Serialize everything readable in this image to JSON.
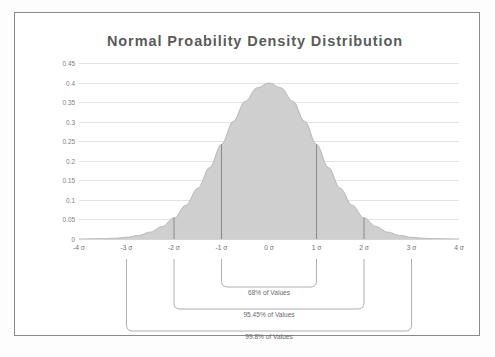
{
  "chart_data": {
    "type": "area",
    "title": "Normal Proability Density Distribution",
    "xlabel": "",
    "ylabel": "",
    "xlim": [
      -4,
      4
    ],
    "ylim": [
      0,
      0.45
    ],
    "grid": true,
    "legend": "none",
    "x_tick_labels": [
      "-4 σ",
      "-3 σ",
      "-2 σ",
      "-1 σ",
      "0 σ",
      "1 σ",
      "2 σ",
      "3 σ",
      "4 σ"
    ],
    "x_tick_values": [
      -4,
      -3,
      -2,
      -1,
      0,
      1,
      2,
      3,
      4
    ],
    "y_tick_labels": [
      "0.45",
      "0.4",
      "0.35",
      "0.3",
      "0.25",
      "0.2",
      "0.15",
      "0.1",
      "0.05",
      "0"
    ],
    "y_tick_values": [
      0.45,
      0.4,
      0.35,
      0.3,
      0.25,
      0.2,
      0.15,
      0.1,
      0.05,
      0
    ],
    "series": [
      {
        "name": "Normal PDF",
        "fill_color": "#cfcfcf",
        "line_color": "#b4b4b4",
        "x": [
          -4,
          -3.75,
          -3.5,
          -3.25,
          -3,
          -2.75,
          -2.5,
          -2.25,
          -2,
          -1.75,
          -1.5,
          -1.25,
          -1,
          -0.75,
          -0.5,
          -0.25,
          0,
          0.25,
          0.5,
          0.75,
          1,
          1.25,
          1.5,
          1.75,
          2,
          2.25,
          2.5,
          2.75,
          3,
          3.25,
          3.5,
          3.75,
          4
        ],
        "values": [
          0.0001,
          0.0004,
          0.0009,
          0.002,
          0.0044,
          0.0091,
          0.0175,
          0.0317,
          0.054,
          0.0863,
          0.1295,
          0.1826,
          0.242,
          0.3011,
          0.3521,
          0.3867,
          0.3989,
          0.3867,
          0.3521,
          0.3011,
          0.242,
          0.1826,
          0.1295,
          0.0863,
          0.054,
          0.0317,
          0.0175,
          0.0091,
          0.0044,
          0.002,
          0.0009,
          0.0004,
          0.0001
        ]
      }
    ],
    "drop_lines": [
      {
        "x": -2,
        "y": 0.054
      },
      {
        "x": -1,
        "y": 0.242
      },
      {
        "x": 1,
        "y": 0.242
      },
      {
        "x": 2,
        "y": 0.054
      }
    ],
    "annotations": [
      {
        "label": "68% of Values",
        "from": -1,
        "to": 1
      },
      {
        "label": "95.45% of Values",
        "from": -2,
        "to": 2
      },
      {
        "label": "99.8% of Values",
        "from": -3,
        "to": 3
      }
    ]
  },
  "chart": {
    "title": "Normal Proability Density Distribution",
    "title_color": "#5b5b5b",
    "axis_label_color": "#6e6e6e",
    "gridline_color": "#e3e3e3",
    "area_fill_color": "#cfcfcf",
    "dropline_color": "#6a6a6a",
    "bracket_color": "#9a9a9a"
  },
  "y_ticks": [
    {
      "label": "0.45",
      "value": 0.45
    },
    {
      "label": "0.4",
      "value": 0.4
    },
    {
      "label": "0.35",
      "value": 0.35
    },
    {
      "label": "0.3",
      "value": 0.3
    },
    {
      "label": "0.25",
      "value": 0.25
    },
    {
      "label": "0.2",
      "value": 0.2
    },
    {
      "label": "0.15",
      "value": 0.15
    },
    {
      "label": "0.1",
      "value": 0.1
    },
    {
      "label": "0.05",
      "value": 0.05
    },
    {
      "label": "0",
      "value": 0
    }
  ],
  "x_ticks": [
    {
      "label": "-4 σ",
      "value": -4
    },
    {
      "label": "-3 σ",
      "value": -3
    },
    {
      "label": "-2 σ",
      "value": -2
    },
    {
      "label": "-1 σ",
      "value": -1
    },
    {
      "label": "0 σ",
      "value": 0
    },
    {
      "label": "1 σ",
      "value": 1
    },
    {
      "label": "2 σ",
      "value": 2
    },
    {
      "label": "3 σ",
      "value": 3
    },
    {
      "label": "4 σ",
      "value": 4
    }
  ],
  "brackets": [
    {
      "label": "68% of Values",
      "from": -1,
      "to": 1
    },
    {
      "label": "95.45% of Values",
      "from": -2,
      "to": 2
    },
    {
      "label": "99.8% of Values",
      "from": -3,
      "to": 3
    }
  ]
}
